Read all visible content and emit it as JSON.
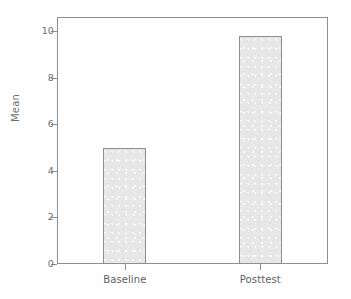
{
  "chart_data": {
    "type": "bar",
    "title": "",
    "subtitle": "",
    "xlabel": "",
    "ylabel": "Mean",
    "categories": [
      "Baseline",
      "Posttest"
    ],
    "values": [
      5.0,
      9.8
    ],
    "series": [
      {
        "name": "Mean",
        "values": [
          5.0,
          9.8
        ]
      }
    ],
    "ylim": [
      0,
      10.6
    ],
    "yticks": [
      0,
      2,
      4,
      6,
      8,
      10
    ],
    "ytick_labels": [
      "0",
      "2",
      "4",
      "6",
      "8",
      "10"
    ],
    "xtick_labels": [
      "Baseline",
      "Posttest"
    ],
    "grid": false,
    "legend": false,
    "legend_position": "none",
    "annotations": [],
    "style": {
      "bar_fill": "#e7e7e7",
      "bar_stroke": "#8e8e8e",
      "axis_color": "#8e8e8e",
      "tick_label_color": "#6f6f6f",
      "category_label_color": "#5e5e5e",
      "plot_background": "#ffffff",
      "figure_background": "#ffffff"
    }
  }
}
